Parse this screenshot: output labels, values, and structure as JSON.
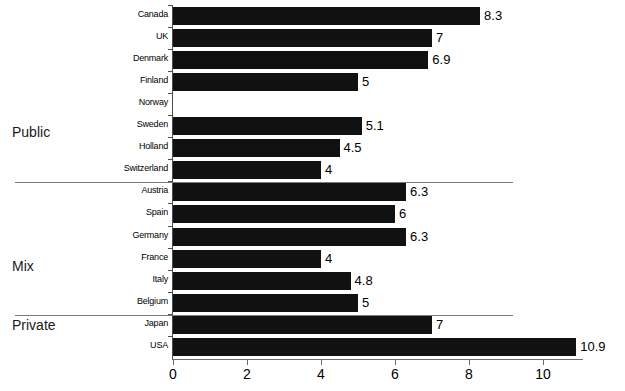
{
  "chart_data": {
    "type": "bar",
    "orientation": "horizontal",
    "title": "",
    "subtitle": "",
    "xlabel": "",
    "ylabel": "",
    "xlim": [
      0,
      11.1
    ],
    "xticks": [
      0,
      2,
      4,
      6,
      8,
      10
    ],
    "xtick_labels": [
      "0",
      "2",
      "4",
      "6",
      "8",
      "10"
    ],
    "grid": false,
    "legend": "none",
    "bar_color": "#111111",
    "axis_color": "#6b6b6b",
    "separator_color": "#7a7a7a",
    "categories": [
      "Canada",
      "UK",
      "Denmark",
      "Finland",
      "Norway",
      "Sweden",
      "Holland",
      "Switzerland",
      "Austria",
      "Spain",
      "Germany",
      "France",
      "Italy",
      "Belgium",
      "Japan",
      "USA"
    ],
    "values": [
      8.3,
      7,
      6.9,
      5,
      null,
      5.1,
      4.5,
      4,
      6.3,
      6,
      6.3,
      4,
      4.8,
      5,
      7,
      10.9
    ],
    "value_labels": [
      "8.3",
      "7",
      "6.9",
      "5",
      "",
      "5.1",
      "4.5",
      "4",
      "6.3",
      "6",
      "6.3",
      "4",
      "4.8",
      "5",
      "7",
      "10.9"
    ],
    "groups": [
      {
        "name": "Public",
        "start_index": 0,
        "end_index": 7
      },
      {
        "name": "Mix",
        "start_index": 8,
        "end_index": 13
      },
      {
        "name": "Private",
        "start_index": 14,
        "end_index": 15
      }
    ],
    "group_labels": [
      "Public",
      "Mix",
      "Private"
    ]
  }
}
